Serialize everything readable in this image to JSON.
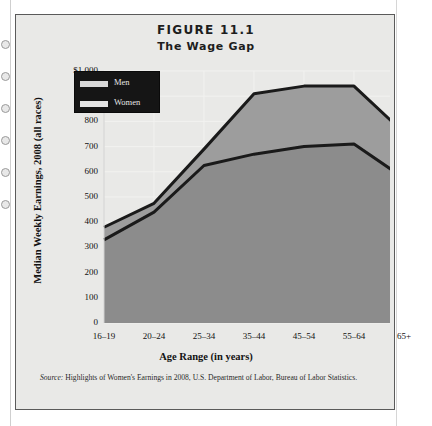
{
  "figure": {
    "number": "FIGURE 11.1",
    "subtitle": "The Wage Gap",
    "source": "Highlights of Women's Earnings in 2008, U.S. Department of Labor, Bureau of Labor Statistics.",
    "source_prefix": "Source:"
  },
  "legend": {
    "items": [
      {
        "label": "Men",
        "color": "#d8d8d8"
      },
      {
        "label": "Women",
        "color": "#e4e4e4"
      }
    ]
  },
  "colors": {
    "panel_background": "#e9e9e7",
    "area_men": "#9d9d9d",
    "area_women": "#8e8e8e",
    "line": "#1a1a1a",
    "grid": "#f2f2f0",
    "legend_background": "#151515"
  },
  "chart_data": {
    "type": "area",
    "title": "The Wage Gap",
    "subtitle": "FIGURE 11.1",
    "xlabel": "Age Range (in years)",
    "ylabel": "Median Weekly Earnings, 2008 (all races)",
    "categories": [
      "16–19",
      "20–24",
      "25–34",
      "35–44",
      "45–54",
      "55–64",
      "65+"
    ],
    "series": [
      {
        "name": "Men",
        "values": [
          380,
          475,
          690,
          910,
          940,
          940,
          755
        ]
      },
      {
        "name": "Women",
        "values": [
          330,
          440,
          625,
          670,
          700,
          710,
          575
        ]
      }
    ],
    "ylim": [
      0,
      1000
    ],
    "yticks": [
      0,
      100,
      200,
      300,
      400,
      500,
      600,
      700,
      800,
      900,
      1000
    ],
    "ytick_labels": [
      "0",
      "100",
      "200",
      "300",
      "400",
      "500",
      "600",
      "700",
      "800",
      "900",
      "$1,000"
    ],
    "grid": true,
    "legend_position": "upper left"
  }
}
